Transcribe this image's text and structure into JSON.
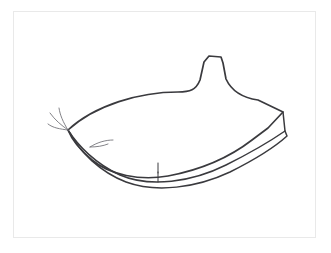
{
  "document": {
    "title": "Line drawing sketch",
    "medium": "ink line drawing",
    "background_color": "#ffffff",
    "ink_color": "#3a3a3e",
    "secondary_ink_color": "#6d6d72",
    "frame": {
      "name": "image-border",
      "color": "#e9e9e9",
      "left": 13,
      "top": 11,
      "width": 303,
      "height": 227,
      "stroke_width": 1
    }
  },
  "subject": {
    "description": "Outline sketch of an elongated pod-like leaf form with a narrow neck rising at the upper right, a pointed tip at the left with fine whisker strokes, and a double-layered curved lower edge",
    "orientation": "horizontal, tapering left",
    "visible_text": ""
  },
  "strokes": {
    "body_outline": {
      "name": "body-outline",
      "path": "M 68 130 C 95 105, 140 92, 178 92 C 190 92, 196 90, 200 80 L 204 62 L 209 56 L 221 57 L 223 63 L 226 79 C 232 92, 244 98, 258 100 L 283 112 L 268 128 L 252 140 C 230 157, 200 170, 168 176 C 140 181, 110 175, 92 160 C 80 150, 72 140, 68 130 Z"
    },
    "lower_layer": {
      "name": "lower-layer-outline",
      "path": "M 68 130 C 78 146, 96 164, 120 175 C 150 188, 192 182, 226 165 C 252 152, 272 140, 285 131 L 283 112"
    },
    "lower_layer_edge": {
      "name": "lower-layer-lower-edge",
      "path": "M 70 133 C 80 152, 100 172, 126 182 C 156 193, 196 188, 230 172 C 256 159, 276 146, 287 136 L 285 131"
    },
    "tendrils": [
      {
        "name": "tendril-upper",
        "path": "M 68 130 C 63 122, 60 115, 59 108"
      },
      {
        "name": "tendril-middle",
        "path": "M 68 130 C 61 125, 55 120, 50 113"
      },
      {
        "name": "tendril-lower",
        "path": "M 68 130 C 60 129, 53 128, 48 124"
      },
      {
        "name": "tendril-inner",
        "path": "M 90 147 C 98 142, 106 140, 113 140"
      },
      {
        "name": "tendril-inner-short",
        "path": "M 90 147 C 97 147, 103 146, 108 144"
      }
    ],
    "ticks": [
      {
        "name": "tick-mark-upper",
        "x1": 158,
        "y1": 163,
        "x2": 158,
        "y2": 173
      },
      {
        "name": "tick-mark-lower",
        "x1": 158,
        "y1": 172,
        "x2": 158,
        "y2": 182
      }
    ]
  }
}
